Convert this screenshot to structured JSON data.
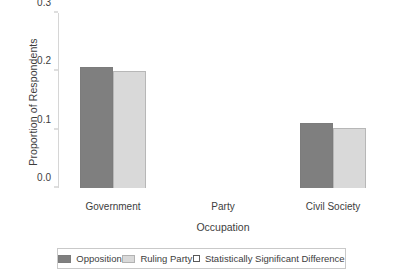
{
  "chart_data": {
    "type": "bar",
    "title": "",
    "xlabel": "Occupation",
    "ylabel": "Proportion of Respondents",
    "categories": [
      "Government",
      "Party",
      "Civil Society"
    ],
    "ylim": [
      0.0,
      0.3
    ],
    "yticks": [
      "0.0",
      "0.1",
      "0.2",
      "0.3"
    ],
    "ytick_values": [
      0.0,
      0.1,
      0.2,
      0.3
    ],
    "grid": false,
    "legend_position": "bottom",
    "series": [
      {
        "name": "Opposition",
        "color": "#7f7f7f",
        "values": [
          0.208,
          0.0,
          0.111
        ]
      },
      {
        "name": "Ruling Party",
        "color": "#d9d9d9",
        "values": [
          0.2,
          0.0,
          0.103
        ]
      }
    ],
    "legend": [
      {
        "label": "Opposition",
        "swatch": "filled-dark",
        "color": "#7f7f7f"
      },
      {
        "label": "Ruling Party",
        "swatch": "filled-light",
        "color": "#d9d9d9"
      },
      {
        "label": "Statistically Significant Difference",
        "swatch": "open-square",
        "color": "#ffffff"
      }
    ]
  }
}
